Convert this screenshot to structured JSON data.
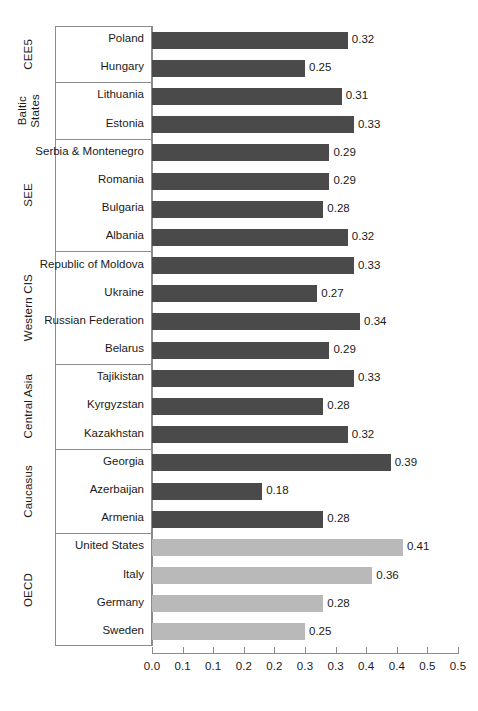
{
  "chart_data": {
    "type": "bar",
    "orientation": "horizontal",
    "title": "",
    "subtitle": "",
    "xlabel": "",
    "ylabel": "",
    "xlim": [
      0.0,
      0.5
    ],
    "grid": false,
    "legend": "none",
    "xticks": [
      0.0,
      0.05,
      0.1,
      0.15,
      0.2,
      0.25,
      0.3,
      0.35,
      0.4,
      0.45,
      0.5
    ],
    "xtick_labels": [
      "0.0",
      "0.1",
      "0.1",
      "0.2",
      "0.2",
      "0.3",
      "0.3",
      "0.4",
      "0.4",
      "0.5"
    ],
    "colors": {
      "transition_bar": "#4a4a4a",
      "oecd_bar": "#b9b9b9",
      "axis": "#8c8c8c",
      "text": "#1a1a1a",
      "background": "#ffffff"
    },
    "groups": [
      {
        "name": "CEE5",
        "color_key": "transition_bar",
        "items": [
          {
            "label": "Poland",
            "value": 0.32,
            "value_label": "0.32"
          },
          {
            "label": "Hungary",
            "value": 0.25,
            "value_label": "0.25"
          }
        ]
      },
      {
        "name": "Baltic States",
        "name_lines": [
          "Baltic",
          "States"
        ],
        "color_key": "transition_bar",
        "items": [
          {
            "label": "Lithuania",
            "value": 0.31,
            "value_label": "0.31"
          },
          {
            "label": "Estonia",
            "value": 0.33,
            "value_label": "0.33"
          }
        ]
      },
      {
        "name": "SEE",
        "color_key": "transition_bar",
        "items": [
          {
            "label": "Serbia & Montenegro",
            "value": 0.29,
            "value_label": "0.29"
          },
          {
            "label": "Romania",
            "value": 0.29,
            "value_label": "0.29"
          },
          {
            "label": "Bulgaria",
            "value": 0.28,
            "value_label": "0.28"
          },
          {
            "label": "Albania",
            "value": 0.32,
            "value_label": "0.32"
          }
        ]
      },
      {
        "name": "Western CIS",
        "color_key": "transition_bar",
        "items": [
          {
            "label": "Republic of Moldova",
            "value": 0.33,
            "value_label": "0.33"
          },
          {
            "label": "Ukraine",
            "value": 0.27,
            "value_label": "0.27"
          },
          {
            "label": "Russian Federation",
            "value": 0.34,
            "value_label": "0.34"
          },
          {
            "label": "Belarus",
            "value": 0.29,
            "value_label": "0.29"
          }
        ]
      },
      {
        "name": "Central Asia",
        "color_key": "transition_bar",
        "items": [
          {
            "label": "Tajikistan",
            "value": 0.33,
            "value_label": "0.33"
          },
          {
            "label": "Kyrgyzstan",
            "value": 0.28,
            "value_label": "0.28"
          },
          {
            "label": "Kazakhstan",
            "value": 0.32,
            "value_label": "0.32"
          }
        ]
      },
      {
        "name": "Caucasus",
        "color_key": "transition_bar",
        "items": [
          {
            "label": "Georgia",
            "value": 0.39,
            "value_label": "0.39"
          },
          {
            "label": "Azerbaijan",
            "value": 0.18,
            "value_label": "0.18"
          },
          {
            "label": "Armenia",
            "value": 0.28,
            "value_label": "0.28"
          }
        ]
      },
      {
        "name": "OECD",
        "color_key": "oecd_bar",
        "items": [
          {
            "label": "United States",
            "value": 0.41,
            "value_label": "0.41"
          },
          {
            "label": "Italy",
            "value": 0.36,
            "value_label": "0.36"
          },
          {
            "label": "Germany",
            "value": 0.28,
            "value_label": "0.28"
          },
          {
            "label": "Sweden",
            "value": 0.25,
            "value_label": "0.25"
          }
        ]
      }
    ]
  }
}
